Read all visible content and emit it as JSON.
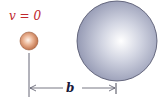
{
  "diagram": {
    "velocity_label": "v = 0",
    "distance_label": "b",
    "colors": {
      "velocity_label": "#c0282e",
      "small_ball": "#d98b63",
      "large_sphere": "#a9adc4",
      "lines": "#333344"
    },
    "objects": [
      {
        "name": "small-ball",
        "shape": "circle"
      },
      {
        "name": "large-sphere",
        "shape": "circle"
      }
    ]
  }
}
